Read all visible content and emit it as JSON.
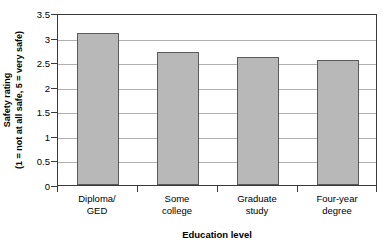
{
  "chart_data": {
    "type": "bar",
    "title": "",
    "categories": [
      "Diploma/ GED",
      "Some college",
      "Graduate study",
      "Four-year degree"
    ],
    "category_lines": [
      [
        "Diploma/",
        "GED"
      ],
      [
        "Some",
        "college"
      ],
      [
        "Graduate",
        "study"
      ],
      [
        "Four-year",
        "degree"
      ]
    ],
    "values": [
      3.1,
      2.7,
      2.6,
      2.55
    ],
    "series": [
      {
        "name": "Safety rating",
        "values": [
          3.1,
          2.7,
          2.6,
          2.55
        ]
      }
    ],
    "xlabel": "Education level",
    "ylabel": "Safety rating",
    "ylabel_line1": "Safety rating",
    "ylabel_line2": "(1 = not at all safe, 5 = very safe)",
    "ylim": [
      0,
      3.5
    ],
    "yticks": [
      0,
      0.5,
      1,
      1.5,
      2,
      2.5,
      3,
      3.5
    ],
    "ytick_labels": [
      "0",
      "0.5",
      "1",
      "1.5",
      "2",
      "2.5",
      "3",
      "3.5"
    ],
    "grid": true,
    "grid_axis": "y",
    "legend": false,
    "legend_position": "none",
    "bar_color": "#b8b8b8",
    "bar_border_color": "#5a5a5a",
    "grid_color": "#b0b0b0",
    "frame_color": "#3a3a3a",
    "background_color": "#ffffff"
  }
}
